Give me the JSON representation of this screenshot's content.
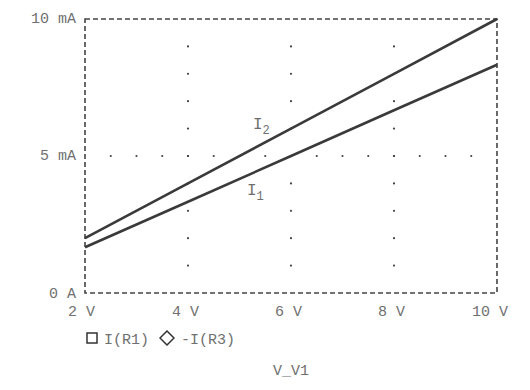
{
  "chart_data": {
    "type": "line",
    "title": "",
    "xlabel": "V_V1",
    "ylabel": "",
    "xlim": [
      2,
      10
    ],
    "ylim": [
      0,
      10
    ],
    "x_unit": "V",
    "y_unit": "mA",
    "x_ticks": [
      "2 V",
      "4 V",
      "6 V",
      "8 V",
      "10 V"
    ],
    "y_ticks": [
      "0 A",
      "5 mA",
      "10 mA"
    ],
    "grid": "dotted",
    "x": [
      2,
      4,
      6,
      8,
      10
    ],
    "series": [
      {
        "name": "I(R1)",
        "marker": "square",
        "curve_label": "I2",
        "values": [
          2.0,
          4.0,
          6.0,
          8.0,
          10.0
        ]
      },
      {
        "name": "-I(R3)",
        "marker": "diamond",
        "curve_label": "I1",
        "values": [
          1.67,
          3.33,
          5.0,
          6.67,
          8.33
        ]
      }
    ],
    "legend_position": "bottom-left"
  },
  "axes": {
    "y_labels": [
      {
        "text": "10 mA",
        "value": 10
      },
      {
        "text": "5 mA",
        "value": 5
      },
      {
        "text": "0 A",
        "value": 0
      }
    ],
    "x_labels": [
      {
        "text": "2 V",
        "value": 2
      },
      {
        "text": "4 V",
        "value": 4
      },
      {
        "text": "6 V",
        "value": 6
      },
      {
        "text": "8 V",
        "value": 8
      },
      {
        "text": "10 V",
        "value": 10
      }
    ],
    "x_title": "V_V1"
  },
  "legend": {
    "items": [
      {
        "symbol": "□",
        "label": "I(R1)"
      },
      {
        "symbol": "◇",
        "label": "-I(R3)"
      }
    ]
  },
  "curve_labels": {
    "upper": {
      "main": "I",
      "sub": "2"
    },
    "lower": {
      "main": "I",
      "sub": "1"
    }
  },
  "colors": {
    "line": "#3a3a3a",
    "frame": "#444444",
    "grid_dot": "#444444",
    "text": "#707070"
  }
}
